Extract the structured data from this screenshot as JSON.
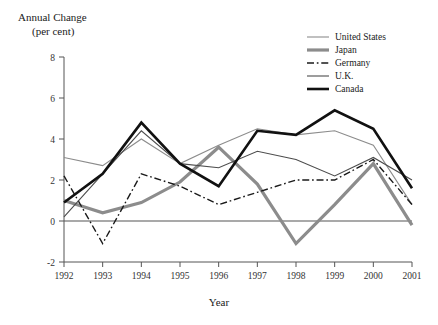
{
  "chart_data": {
    "type": "line",
    "title": "Annual Change",
    "subtitle": "(per cent)",
    "xlabel": "Year",
    "ylabel": "Annual Change (per cent)",
    "categories": [
      "1992",
      "1993",
      "1994",
      "1995",
      "1996",
      "1997",
      "1998",
      "1999",
      "2000",
      "2001"
    ],
    "x": [
      1992,
      1993,
      1994,
      1995,
      1996,
      1997,
      1998,
      1999,
      2000,
      2001
    ],
    "xlim": [
      1992,
      2001
    ],
    "ylim": [
      -2,
      8
    ],
    "yticks": [
      -2,
      0,
      2,
      4,
      6,
      8
    ],
    "ytick_labels": [
      "-2",
      "0",
      "2",
      "4",
      "6",
      "8"
    ],
    "grid": false,
    "legend_position": "top-right",
    "zero_line": true,
    "series": [
      {
        "name": "United States",
        "color": "#8c8c8c",
        "width": 1.1,
        "dash": "none",
        "values": [
          3.1,
          2.7,
          4.0,
          2.8,
          3.7,
          4.5,
          4.2,
          4.4,
          3.7,
          0.8
        ]
      },
      {
        "name": "Japan",
        "color": "#8c8c8c",
        "width": 3.2,
        "dash": "none",
        "values": [
          1.0,
          0.4,
          0.9,
          1.9,
          3.6,
          1.8,
          -1.1,
          0.8,
          2.8,
          -0.2
        ]
      },
      {
        "name": "Germany",
        "color": "#1a1a1a",
        "width": 1.4,
        "dash": "dashdot",
        "values": [
          2.2,
          -1.1,
          2.3,
          1.7,
          0.8,
          1.4,
          2.0,
          2.0,
          3.0,
          0.8
        ]
      },
      {
        "name": "U.K.",
        "color": "#4d4d4d",
        "width": 1.1,
        "dash": "none",
        "values": [
          0.2,
          2.3,
          4.4,
          2.8,
          2.6,
          3.4,
          3.0,
          2.2,
          3.1,
          2.0
        ]
      },
      {
        "name": "Canada",
        "color": "#111111",
        "width": 2.6,
        "dash": "none",
        "values": [
          0.9,
          2.3,
          4.8,
          2.8,
          1.7,
          4.4,
          4.2,
          5.4,
          4.5,
          1.6
        ]
      }
    ]
  },
  "legend": {
    "items": [
      {
        "label": "United States"
      },
      {
        "label": "Japan"
      },
      {
        "label": "Germany"
      },
      {
        "label": "U.K."
      },
      {
        "label": "Canada"
      }
    ]
  }
}
